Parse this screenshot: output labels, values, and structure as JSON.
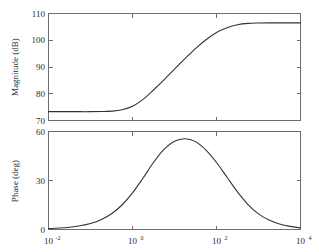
{
  "figure": {
    "background_color": "#ffffff",
    "axis_color": "#6e6e6e",
    "curve_color": "#333333",
    "text_color": "#2b2b2b"
  },
  "chart_data": [
    {
      "type": "line",
      "name": "magnitude-plot",
      "title": "",
      "xlabel": "",
      "ylabel": "Magnitude (dB)",
      "xscale": "log",
      "xlim": [
        0.01,
        10000
      ],
      "ylim": [
        70,
        110
      ],
      "grid": false,
      "legend": "none",
      "yticks": [
        70,
        80,
        90,
        100,
        110
      ],
      "ytick_labels": [
        "70",
        "80",
        "90",
        "100",
        "110"
      ],
      "xticks": [
        0.01,
        1,
        100,
        10000
      ],
      "xtick_labels": [
        "10",
        "10",
        "10",
        "10"
      ],
      "xtick_exponents": [
        "-2",
        "0",
        "2",
        "4"
      ],
      "x": [
        0.01,
        0.0178,
        0.0316,
        0.0562,
        0.1,
        0.178,
        0.316,
        0.562,
        1.0,
        1.78,
        3.16,
        5.62,
        10.0,
        17.8,
        31.6,
        56.2,
        100.0,
        178.0,
        316.0,
        562.0,
        1000.0,
        1780.0,
        3160.0,
        5620.0,
        10000.0
      ],
      "values": [
        73.3,
        73.3,
        73.3,
        73.3,
        73.3,
        73.35,
        73.5,
        74.0,
        75.3,
        77.9,
        81.4,
        85.2,
        89.2,
        93.1,
        96.9,
        100.2,
        102.9,
        104.7,
        105.8,
        106.3,
        106.45,
        106.5,
        106.5,
        106.5,
        106.5
      ]
    },
    {
      "type": "line",
      "name": "phase-plot",
      "title": "",
      "xlabel": "",
      "ylabel": "Phase (deg)",
      "xscale": "log",
      "xlim": [
        0.01,
        10000
      ],
      "ylim": [
        0,
        60
      ],
      "grid": false,
      "legend": "none",
      "yticks": [
        0,
        30,
        60
      ],
      "ytick_labels": [
        "0",
        "30",
        "60"
      ],
      "xticks": [
        0.01,
        1,
        100,
        10000
      ],
      "xtick_labels": [
        "10",
        "10",
        "10",
        "10"
      ],
      "xtick_exponents": [
        "-2",
        "0",
        "2",
        "4"
      ],
      "x": [
        0.01,
        0.0178,
        0.0316,
        0.0562,
        0.1,
        0.178,
        0.316,
        0.562,
        1.0,
        1.78,
        3.16,
        5.62,
        10.0,
        17.8,
        31.6,
        56.2,
        100.0,
        178.0,
        316.0,
        562.0,
        1000.0,
        1780.0,
        3160.0,
        5620.0,
        10000.0
      ],
      "values": [
        0.6,
        0.9,
        1.4,
        2.3,
        3.7,
        6.0,
        9.6,
        15.0,
        22.4,
        31.5,
        41.0,
        49.0,
        54.0,
        55.6,
        53.8,
        48.6,
        41.0,
        32.0,
        23.0,
        15.3,
        9.6,
        5.8,
        3.4,
        1.9,
        1.0
      ]
    }
  ]
}
